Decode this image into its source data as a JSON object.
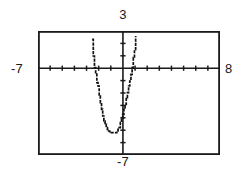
{
  "figure": {
    "kind": "graphing-calculator-plot",
    "frame_color": "#1a1a1a",
    "axis_color": "#1a1a1a",
    "curve_color": "#111111",
    "background": "#ffffff"
  },
  "labels": {
    "top": "3",
    "bottom": "-7",
    "left": "-7",
    "right": "8"
  },
  "chart_data": {
    "type": "line",
    "title": "",
    "xlabel": "",
    "ylabel": "",
    "grid": false,
    "legend": null,
    "xlim": [
      -7,
      8
    ],
    "ylim": [
      -7,
      3
    ],
    "xtick_step": 1,
    "ytick_step": 1,
    "xticks": [
      -7,
      -6,
      -5,
      -4,
      -3,
      -2,
      -1,
      0,
      1,
      2,
      3,
      4,
      5,
      6,
      7,
      8
    ],
    "yticks": [
      -7,
      -6,
      -5,
      -4,
      -3,
      -2,
      -1,
      0,
      1,
      2,
      3
    ],
    "tick_labels_shown": false,
    "corner_labels": {
      "xmin": "-7",
      "xmax": "8",
      "ymax": "3",
      "ymin": "-7"
    },
    "series": [
      {
        "name": "parabola",
        "shape": "upward-parabola",
        "vertex": [
          -0.7,
          -5.2
        ],
        "x_intercepts": [
          -2.2,
          0.8
        ],
        "y_intercept": -3.5,
        "points": [
          [
            -2.55,
            3.0
          ],
          [
            -2.5,
            2.3
          ],
          [
            -2.45,
            1.6
          ],
          [
            -2.4,
            1.0
          ],
          [
            -2.35,
            0.5
          ],
          [
            -2.3,
            0.1
          ],
          [
            -2.25,
            -0.3
          ],
          [
            -2.2,
            -0.7
          ],
          [
            -2.15,
            -1.1
          ],
          [
            -2.1,
            -1.5
          ],
          [
            -2.0,
            -2.2
          ],
          [
            -1.9,
            -2.8
          ],
          [
            -1.8,
            -3.3
          ],
          [
            -1.7,
            -3.8
          ],
          [
            -1.6,
            -4.2
          ],
          [
            -1.5,
            -4.5
          ],
          [
            -1.4,
            -4.75
          ],
          [
            -1.3,
            -4.95
          ],
          [
            -1.2,
            -5.05
          ],
          [
            -1.1,
            -5.15
          ],
          [
            -1.0,
            -5.2
          ],
          [
            -0.9,
            -5.25
          ],
          [
            -0.8,
            -5.25
          ],
          [
            -0.7,
            -5.25
          ],
          [
            -0.6,
            -5.2
          ],
          [
            -0.5,
            -5.1
          ],
          [
            -0.4,
            -4.95
          ],
          [
            -0.3,
            -4.75
          ],
          [
            -0.2,
            -4.45
          ],
          [
            -0.1,
            -4.1
          ],
          [
            0.0,
            -3.7
          ],
          [
            0.1,
            -3.3
          ],
          [
            0.2,
            -2.85
          ],
          [
            0.3,
            -2.4
          ],
          [
            0.4,
            -1.95
          ],
          [
            0.5,
            -1.5
          ],
          [
            0.6,
            -1.0
          ],
          [
            0.7,
            -0.5
          ],
          [
            0.8,
            0.0
          ],
          [
            0.85,
            0.4
          ],
          [
            0.9,
            0.9
          ],
          [
            0.95,
            1.4
          ],
          [
            1.0,
            2.0
          ],
          [
            1.05,
            2.6
          ],
          [
            1.1,
            3.0
          ]
        ]
      }
    ]
  }
}
